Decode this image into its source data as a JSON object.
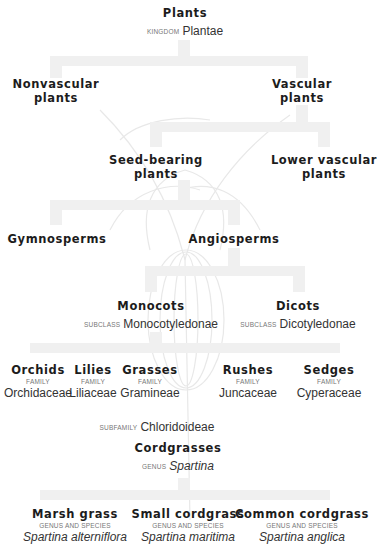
{
  "colors": {
    "connector": "#f0f0f0",
    "text": "#1c1c1c",
    "rank": "#777777",
    "art": "#e6e6e6"
  },
  "root": {
    "name": "Plants",
    "rank": "KINGDOM",
    "sci": "Plantae"
  },
  "level1": {
    "nonvascular": {
      "name_line1": "Nonvascular",
      "name_line2": "plants"
    },
    "vascular": {
      "name_line1": "Vascular",
      "name_line2": "plants"
    }
  },
  "level2": {
    "seed_bearing": {
      "name_line1": "Seed-bearing",
      "name_line2": "plants"
    },
    "lower_vascular": {
      "name_line1": "Lower vascular",
      "name_line2": "plants"
    }
  },
  "level3": {
    "gymnosperms": {
      "name": "Gymnosperms"
    },
    "angiosperms": {
      "name": "Angiosperms"
    }
  },
  "level4": {
    "monocots": {
      "name": "Monocots",
      "rank": "SUBCLASS",
      "sci": "Monocotyledonae"
    },
    "dicots": {
      "name": "Dicots",
      "rank": "SUBCLASS",
      "sci": "Dicotyledonae"
    }
  },
  "families": [
    {
      "name": "Orchids",
      "rank": "FAMILY",
      "sci": "Orchidaceae"
    },
    {
      "name": "Lilies",
      "rank": "FAMILY",
      "sci": "Liliaceae"
    },
    {
      "name": "Grasses",
      "rank": "FAMILY",
      "sci": "Gramineae"
    },
    {
      "name": "Rushes",
      "rank": "FAMILY",
      "sci": "Juncaceae"
    },
    {
      "name": "Sedges",
      "rank": "FAMILY",
      "sci": "Cyperaceae"
    }
  ],
  "subfamily": {
    "rank": "SUBFAMILY",
    "sci": "Chloridoideae"
  },
  "genus": {
    "name": "Cordgrasses",
    "rank": "GENUS",
    "sci": "Spartina"
  },
  "species": [
    {
      "name": "Marsh grass",
      "rank": "GENUS AND SPECIES",
      "sci": "Spartina alterniflora"
    },
    {
      "name": "Small cordgrass",
      "rank": "GENUS AND SPECIES",
      "sci": "Spartina maritima"
    },
    {
      "name": "Common cordgrass",
      "rank": "GENUS AND SPECIES",
      "sci": "Spartina anglica"
    }
  ]
}
